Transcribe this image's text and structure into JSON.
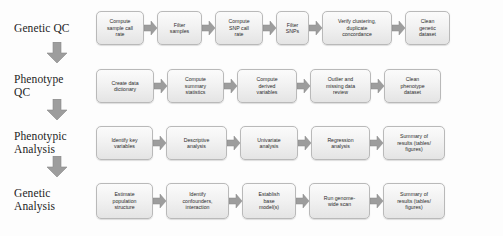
{
  "diagram": {
    "type": "flowchart",
    "colors": {
      "node_fill_top": "#fbfbfb",
      "node_fill_bottom": "#e4e4e4",
      "node_border": "#b9b9b9",
      "arrow_fill": "#9d9d9d",
      "arrow_border": "#808080",
      "label_text": "#1d1d1d",
      "node_text": "#2b2b2b",
      "background": "#fdfdfd"
    },
    "stages": [
      {
        "label": "Genetic QC",
        "steps": [
          "Compute\nsample call\nrate",
          "Filter\nsamples",
          "Compute\nSNP call\nrate",
          "Filter\nSNPs",
          "Verify clustering,\nduplicate\nconcordance",
          "Clean\ngenetic\ndataset"
        ]
      },
      {
        "label": "Phenotype\nQC",
        "steps": [
          "Create data\ndictionary",
          "Compute\nsummary\nstatistics",
          "Compute\nderived\nvariables",
          "Outlier and\nmissing data\nreview",
          "Clean\nphenotype\ndataset"
        ]
      },
      {
        "label": "Phenotypic\nAnalysis",
        "steps": [
          "Identify key\nvariables",
          "Descriptive\nanalysis",
          "Univariate\nanalysis",
          "Regression\nanalysis",
          "Summary of\nresults (tables/\nfigures)"
        ]
      },
      {
        "label": "Genetic\nAnalysis",
        "steps": [
          "Estimate\npopulation\nstructure",
          "Identify\nconfounders,\ninteraction",
          "Establish\nbase\nmodel(s)",
          "Run genome-\nwide scan",
          "Summary of\nresults (tables/\nfigures)"
        ]
      }
    ],
    "stage_connectors": [
      "down-arrow",
      "down-arrow",
      "down-arrow"
    ]
  }
}
